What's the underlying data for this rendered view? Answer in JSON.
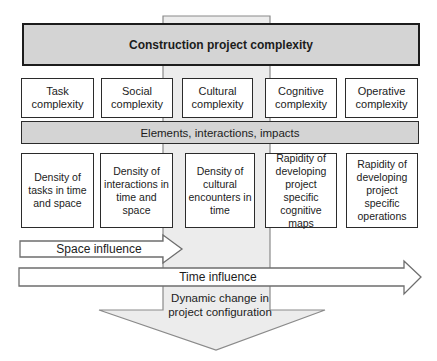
{
  "title": "Construction project complexity",
  "elements_bar_label": "Elements, interactions, impacts",
  "complexity": [
    {
      "label": "Task\ncomplexity"
    },
    {
      "label": "Social\ncomplexity"
    },
    {
      "label": "Cultural\ncomplexity"
    },
    {
      "label": "Cognitive\ncomplexity"
    },
    {
      "label": "Operative\ncomplexity"
    }
  ],
  "factors": [
    {
      "label": "Density of\ntasks in time\nand space"
    },
    {
      "label": "Density of\ninteractions in\ntime and\nspace"
    },
    {
      "label": "Density of\ncultural\nencounters in\ntime"
    },
    {
      "label": "Rapidity of\ndeveloping\nproject\nspecific\ncognitive maps"
    },
    {
      "label": "Rapidity of\ndeveloping\nproject\nspecific\noperations"
    }
  ],
  "arrows": {
    "space_label": "Space influence",
    "time_label": "Time influence",
    "down_label": "Dynamic change in\nproject configuration"
  },
  "colors": {
    "band_fill": "#ececec",
    "band_stroke": "#8a8a8a",
    "header_fill": "#d4d4d4",
    "header_border": "#1c1c1c",
    "bar_fill": "#d4d4d4",
    "box_border": "#2b2b2b",
    "arrow_fill": "#ffffff",
    "arrow_stroke": "#6e6e6e",
    "text": "#1c1c1c"
  }
}
